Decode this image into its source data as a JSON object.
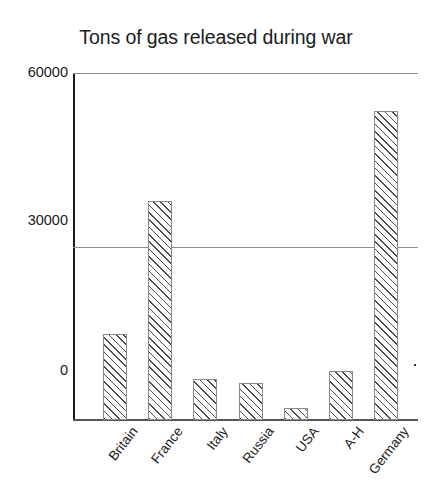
{
  "chart_data": {
    "type": "bar",
    "title": "Tons of gas released during war",
    "xlabel": "",
    "ylabel": "",
    "categories": [
      "Britain",
      "France",
      "Italy",
      "Russia",
      "USA",
      "A-H",
      "Germany"
    ],
    "values": [
      14800,
      37800,
      7100,
      6400,
      2100,
      8500,
      53300
    ],
    "ylim": [
      0,
      60000
    ],
    "ytick_labels": [
      "60000",
      "30000",
      "0"
    ],
    "ytick_values": [
      60000,
      30000,
      0
    ],
    "grid": true,
    "grid_axis": "y",
    "legend": null,
    "series": [
      {
        "name": "Tons of gas released",
        "values": [
          14800,
          37800,
          7100,
          6400,
          2100,
          8500,
          53300
        ]
      }
    ],
    "style": {
      "bar_fill": "diagonal-hatch",
      "bar_border_color": "#8a8a8a",
      "hatch_color": "#4a4a4a",
      "gridline_color": "#8d8d8d",
      "axis_color": "#1a1a1a",
      "text_color": "#1b1b1b",
      "background": "#ffffff"
    }
  },
  "chart": {
    "title": "Tons of gas released during war",
    "y_axis": {
      "tick_60000": "60000",
      "tick_30000": "30000",
      "tick_0": "0"
    },
    "x_axis": {
      "labels": [
        "Britain",
        "France",
        "Italy",
        "Russia",
        "USA",
        "A-H",
        "Germany"
      ]
    }
  }
}
